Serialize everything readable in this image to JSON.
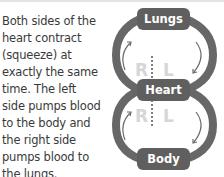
{
  "paragraph": {
    "lines": [
      "Both sides of the",
      "heart contract",
      "(squeeze) at",
      "exactly the same",
      "time. The left",
      "side pumps blood",
      "to the body and",
      "the right side",
      "pumps blood to",
      "the lungs."
    ]
  },
  "diagram": {
    "nodes": {
      "top": "Lungs",
      "middle": "Heart",
      "bottom": "Body"
    },
    "upper_loop": {
      "left_side": "R",
      "right_side": "L"
    },
    "lower_loop": {
      "left_side": "R",
      "right_side": "L"
    },
    "colors": {
      "ring": "#676767",
      "pill": "#5f5f5f",
      "pill_text": "#ffffff",
      "side_letters": "#d6d6d6",
      "arrows": "#6a6a6a",
      "divider": "#555555"
    }
  }
}
